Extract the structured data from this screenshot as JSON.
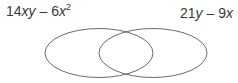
{
  "diagram": {
    "type": "venn",
    "sets": [
      {
        "id": "left",
        "label_parts": {
          "coef1": "14",
          "var1": "xy",
          "op": " – ",
          "coef2": "6",
          "var2": "x",
          "exp": "2"
        },
        "label_text": "14xy – 6x²"
      },
      {
        "id": "right",
        "label_parts": {
          "coef1": "21",
          "var1": "y",
          "op": " – ",
          "coef2": "9",
          "var2": "x"
        },
        "label_text": "21y – 9x"
      }
    ],
    "colors": {
      "stroke": "#6b6b6b",
      "text": "#3a3a3a",
      "background": "#ffffff"
    }
  }
}
